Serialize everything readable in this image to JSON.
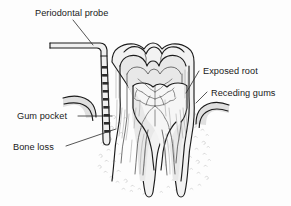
{
  "figure": {
    "background_color": "#fdfdfd",
    "ink_color": "#1c1c1c",
    "label_color": "#1a1a1a"
  },
  "labels": {
    "periodontal_probe": "Periodontal probe",
    "exposed_root": "Exposed root",
    "receding_gums": "Receding gums",
    "gum_pocket": "Gum pocket",
    "bone_loss": "Bone loss"
  },
  "anatomy": {
    "crown": "molar-crown",
    "enamel": "enamel-layer",
    "dentin": "dentin-layer",
    "pulp_chamber": "pulp-chamber",
    "root_left": "root-canal-left",
    "root_right": "root-canal-right",
    "gum_left": "receding-gum-left",
    "gum_right": "receding-gum-right",
    "bone": "alveolar-bone-stipple",
    "probe": "graduated-periodontal-probe"
  }
}
